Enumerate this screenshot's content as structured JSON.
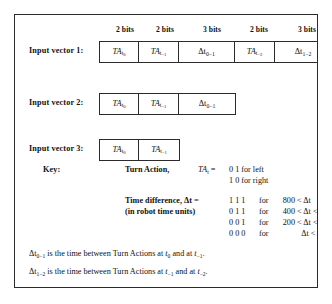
{
  "figure": {
    "bit_headers": [
      {
        "label": "2 bits",
        "center": 26
      },
      {
        "label": "2 bits",
        "center": 66
      },
      {
        "label": "3 bits",
        "center": 113
      },
      {
        "label": "2 bits",
        "center": 160
      },
      {
        "label": "3 bits",
        "center": 208
      }
    ],
    "rows": [
      {
        "label": "Input vector 1:",
        "cells": [
          {
            "base": "TA",
            "sub": "t",
            "sub2": "0",
            "kind": "ta",
            "bits": 2,
            "width": 39
          },
          {
            "base": "TA",
            "sub": "t",
            "sub2": "−1",
            "kind": "ta",
            "bits": 2,
            "width": 40
          },
          {
            "base": "Δt",
            "sub": "0−1",
            "kind": "dt",
            "bits": 3,
            "width": 56
          },
          {
            "base": "TA",
            "sub": "t",
            "sub2": "−2",
            "kind": "ta",
            "bits": 2,
            "width": 40
          },
          {
            "base": "Δt",
            "sub": "1−2",
            "kind": "dt",
            "bits": 3,
            "width": 56
          }
        ]
      },
      {
        "label": "Input vector 2:",
        "cells": [
          {
            "base": "TA",
            "sub": "t",
            "sub2": "0",
            "kind": "ta",
            "bits": 2,
            "width": 39
          },
          {
            "base": "TA",
            "sub": "t",
            "sub2": "−1",
            "kind": "ta",
            "bits": 2,
            "width": 40
          },
          {
            "base": "Δt",
            "sub": "0−1",
            "kind": "dt",
            "bits": 3,
            "width": 56
          }
        ]
      },
      {
        "label": "Input vector 3:",
        "cells": [
          {
            "base": "TA",
            "sub": "t",
            "sub2": "0",
            "kind": "ta",
            "bits": 2,
            "width": 39
          },
          {
            "base": "TA",
            "sub": "t",
            "sub2": "−1",
            "kind": "ta",
            "bits": 2,
            "width": 40
          }
        ]
      }
    ],
    "key": {
      "heading": "Key:",
      "turn_action": {
        "title": "Turn Action,",
        "symbol_base": "TA",
        "symbol_sub": "t",
        "equals": "=",
        "values": [
          {
            "bits": "0 1",
            "text": "for left"
          },
          {
            "bits": "1 0",
            "text": "for right"
          }
        ]
      },
      "time_difference": {
        "title": "Time difference,",
        "symbol_base": "Δt",
        "equals": "=",
        "subtitle": "(in robot time units)",
        "rows": [
          {
            "bits": "1 1 1",
            "for": "for",
            "lower": "800",
            "op1": "<",
            "var": "Δt",
            "op2": "",
            "upper": ""
          },
          {
            "bits": "0 1 1",
            "for": "for",
            "lower": "400",
            "op1": "<",
            "var": "Δt",
            "op2": "<",
            "upper": "800"
          },
          {
            "bits": "0 0 1",
            "for": "for",
            "lower": "200",
            "op1": "<",
            "var": "Δt",
            "op2": "<",
            "upper": "400"
          },
          {
            "bits": "0 0 0",
            "for": "for",
            "lower": "",
            "op1": "",
            "var": "Δt",
            "op2": "<",
            "upper": "200"
          }
        ]
      }
    },
    "notes": [
      {
        "sym_base": "Δt",
        "sym_sub": "0−1",
        "text_a": " is the time between Turn Actions at ",
        "t1_base": "t",
        "t1_sub": "0",
        "text_b": " and at ",
        "t2_base": "t",
        "t2_sub": "−1",
        "text_c": "."
      },
      {
        "sym_base": "Δt",
        "sym_sub": "1−2",
        "text_a": " is the time between Turn Actions at ",
        "t1_base": "t",
        "t1_sub": "−1",
        "text_b": " and at ",
        "t2_base": "t",
        "t2_sub": "−2",
        "text_c": "."
      }
    ]
  }
}
